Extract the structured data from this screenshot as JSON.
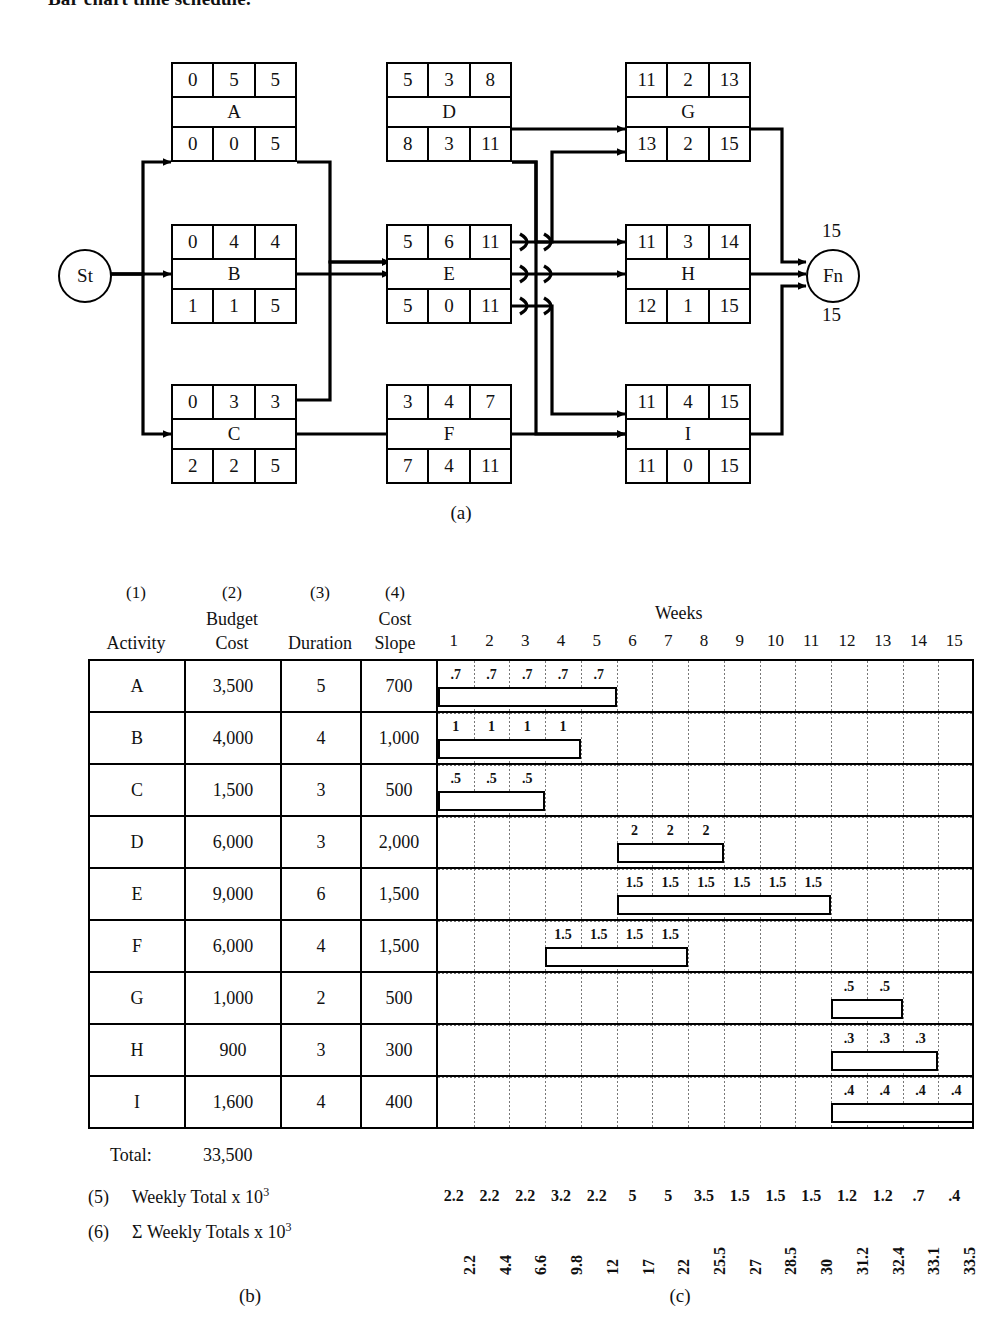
{
  "page": {
    "heading": "Bar chart time schedule."
  },
  "network": {
    "caption": "(a)",
    "start_node": {
      "label": "St"
    },
    "finish_node": {
      "label": "Fn",
      "above": "15",
      "below": "15"
    },
    "nodes": [
      {
        "id": "A",
        "name": "A",
        "top": [
          "0",
          "5",
          "5"
        ],
        "bottom": [
          "0",
          "0",
          "5"
        ]
      },
      {
        "id": "B",
        "name": "B",
        "top": [
          "0",
          "4",
          "4"
        ],
        "bottom": [
          "1",
          "1",
          "5"
        ]
      },
      {
        "id": "C",
        "name": "C",
        "top": [
          "0",
          "3",
          "3"
        ],
        "bottom": [
          "2",
          "2",
          "5"
        ]
      },
      {
        "id": "D",
        "name": "D",
        "top": [
          "5",
          "3",
          "8"
        ],
        "bottom": [
          "8",
          "3",
          "11"
        ]
      },
      {
        "id": "E",
        "name": "E",
        "top": [
          "5",
          "6",
          "11"
        ],
        "bottom": [
          "5",
          "0",
          "11"
        ]
      },
      {
        "id": "F",
        "name": "F",
        "top": [
          "3",
          "4",
          "7"
        ],
        "bottom": [
          "7",
          "4",
          "11"
        ]
      },
      {
        "id": "G",
        "name": "G",
        "top": [
          "11",
          "2",
          "13"
        ],
        "bottom": [
          "13",
          "2",
          "15"
        ]
      },
      {
        "id": "H",
        "name": "H",
        "top": [
          "11",
          "3",
          "14"
        ],
        "bottom": [
          "12",
          "1",
          "15"
        ]
      },
      {
        "id": "I",
        "name": "I",
        "top": [
          "11",
          "4",
          "15"
        ],
        "bottom": [
          "11",
          "0",
          "15"
        ]
      }
    ]
  },
  "schedule": {
    "caption_table": "(b)",
    "caption_chart": "(c)",
    "column_numbers": [
      "(1)",
      "(2)",
      "(3)",
      "(4)"
    ],
    "headers": {
      "activity": "Activity",
      "budget_cost_l1": "Budget",
      "budget_cost_l2": "Cost",
      "duration": "Duration",
      "cost_slope_l1": "Cost",
      "cost_slope_l2": "Slope",
      "weeks": "Weeks"
    },
    "week_labels": [
      "1",
      "2",
      "3",
      "4",
      "5",
      "6",
      "7",
      "8",
      "9",
      "10",
      "11",
      "12",
      "13",
      "14",
      "15"
    ],
    "rows": [
      {
        "activity": "A",
        "budget_cost": "3,500",
        "duration": "5",
        "cost_slope": "700",
        "start_week": 1,
        "length": 5,
        "weekly_labels": [
          ".7",
          ".7",
          ".7",
          ".7",
          ".7"
        ]
      },
      {
        "activity": "B",
        "budget_cost": "4,000",
        "duration": "4",
        "cost_slope": "1,000",
        "start_week": 1,
        "length": 4,
        "weekly_labels": [
          "1",
          "1",
          "1",
          "1"
        ]
      },
      {
        "activity": "C",
        "budget_cost": "1,500",
        "duration": "3",
        "cost_slope": "500",
        "start_week": 1,
        "length": 3,
        "weekly_labels": [
          ".5",
          ".5",
          ".5"
        ]
      },
      {
        "activity": "D",
        "budget_cost": "6,000",
        "duration": "3",
        "cost_slope": "2,000",
        "start_week": 6,
        "length": 3,
        "weekly_labels": [
          "2",
          "2",
          "2"
        ]
      },
      {
        "activity": "E",
        "budget_cost": "9,000",
        "duration": "6",
        "cost_slope": "1,500",
        "start_week": 6,
        "length": 6,
        "weekly_labels": [
          "1.5",
          "1.5",
          "1.5",
          "1.5",
          "1.5",
          "1.5"
        ]
      },
      {
        "activity": "F",
        "budget_cost": "6,000",
        "duration": "4",
        "cost_slope": "1,500",
        "start_week": 4,
        "length": 4,
        "weekly_labels": [
          "1.5",
          "1.5",
          "1.5",
          "1.5"
        ]
      },
      {
        "activity": "G",
        "budget_cost": "1,000",
        "duration": "2",
        "cost_slope": "500",
        "start_week": 12,
        "length": 2,
        "weekly_labels": [
          ".5",
          ".5"
        ]
      },
      {
        "activity": "H",
        "budget_cost": "900",
        "duration": "3",
        "cost_slope": "300",
        "start_week": 12,
        "length": 3,
        "weekly_labels": [
          ".3",
          ".3",
          ".3"
        ]
      },
      {
        "activity": "I",
        "budget_cost": "1,600",
        "duration": "4",
        "cost_slope": "400",
        "start_week": 12,
        "length": 4,
        "weekly_labels": [
          ".4",
          ".4",
          ".4",
          ".4"
        ]
      }
    ],
    "total_label": "Total:",
    "total_value": "33,500",
    "summary_rows": [
      {
        "number": "(5)",
        "label_text": "Weekly Total x 10",
        "exponent": "3"
      },
      {
        "number": "(6)",
        "label_text": "Σ Weekly Totals x 10",
        "exponent": "3"
      }
    ]
  },
  "chart_data": {
    "type": "bar",
    "xlabel": "Weeks",
    "ylabel": "Activity",
    "categories": [
      "A",
      "B",
      "C",
      "D",
      "E",
      "F",
      "G",
      "H",
      "I"
    ],
    "x": [
      1,
      2,
      3,
      4,
      5,
      6,
      7,
      8,
      9,
      10,
      11,
      12,
      13,
      14,
      15
    ],
    "xlim": [
      0,
      15
    ],
    "grid": true,
    "legend": "none",
    "bars": [
      {
        "activity": "A",
        "start_week": 1,
        "duration": 5,
        "budget_cost": 3500,
        "cost_slope": 700,
        "weekly_cost": [
          0.7,
          0.7,
          0.7,
          0.7,
          0.7
        ]
      },
      {
        "activity": "B",
        "start_week": 1,
        "duration": 4,
        "budget_cost": 4000,
        "cost_slope": 1000,
        "weekly_cost": [
          1,
          1,
          1,
          1
        ]
      },
      {
        "activity": "C",
        "start_week": 1,
        "duration": 3,
        "budget_cost": 1500,
        "cost_slope": 500,
        "weekly_cost": [
          0.5,
          0.5,
          0.5
        ]
      },
      {
        "activity": "D",
        "start_week": 6,
        "duration": 3,
        "budget_cost": 6000,
        "cost_slope": 2000,
        "weekly_cost": [
          2,
          2,
          2
        ]
      },
      {
        "activity": "E",
        "start_week": 6,
        "duration": 6,
        "budget_cost": 9000,
        "cost_slope": 1500,
        "weekly_cost": [
          1.5,
          1.5,
          1.5,
          1.5,
          1.5,
          1.5
        ]
      },
      {
        "activity": "F",
        "start_week": 4,
        "duration": 4,
        "budget_cost": 6000,
        "cost_slope": 1500,
        "weekly_cost": [
          1.5,
          1.5,
          1.5,
          1.5
        ]
      },
      {
        "activity": "G",
        "start_week": 12,
        "duration": 2,
        "budget_cost": 1000,
        "cost_slope": 500,
        "weekly_cost": [
          0.5,
          0.5
        ]
      },
      {
        "activity": "H",
        "start_week": 12,
        "duration": 3,
        "budget_cost": 900,
        "cost_slope": 300,
        "weekly_cost": [
          0.3,
          0.3,
          0.3
        ]
      },
      {
        "activity": "I",
        "start_week": 12,
        "duration": 4,
        "budget_cost": 1600,
        "cost_slope": 400,
        "weekly_cost": [
          0.4,
          0.4,
          0.4,
          0.4
        ]
      }
    ],
    "weekly_total_x1000": [
      2.2,
      2.2,
      2.2,
      3.2,
      2.2,
      5,
      5,
      3.5,
      1.5,
      1.5,
      1.5,
      1.2,
      1.2,
      0.7,
      0.4
    ],
    "weekly_total_labels": [
      "2.2",
      "2.2",
      "2.2",
      "3.2",
      "2.2",
      "5",
      "5",
      "3.5",
      "1.5",
      "1.5",
      "1.5",
      "1.2",
      "1.2",
      ".7",
      ".4"
    ],
    "cumulative_total_x1000": [
      2.2,
      4.4,
      6.6,
      9.8,
      12,
      17,
      22,
      25.5,
      27,
      28.5,
      30,
      31.2,
      32.4,
      33.1,
      33.5
    ],
    "cumulative_total_labels": [
      "2.2",
      "4.4",
      "6.6",
      "9.8",
      "12",
      "17",
      "22",
      "25.5",
      "27",
      "28.5",
      "30",
      "31.2",
      "32.4",
      "33.1",
      "33.5"
    ],
    "total_budget_cost": 33500
  }
}
